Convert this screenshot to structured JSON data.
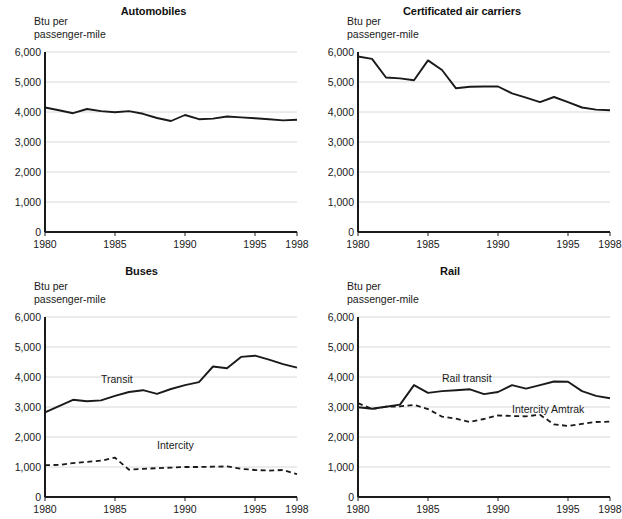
{
  "figure": {
    "axis_label": "Btu per\npassenger-mile",
    "x_ticks": [
      "1980",
      "1985",
      "1990",
      "1995",
      "1998"
    ],
    "x_tick_values": [
      1980,
      1985,
      1990,
      1995,
      1998
    ],
    "y_ticks": [
      "0",
      "1,000",
      "2,000",
      "3,000",
      "4,000",
      "5,000",
      "6,000"
    ],
    "y_tick_values": [
      0,
      1000,
      2000,
      3000,
      4000,
      5000,
      6000
    ],
    "line_color": "#1a1a1a",
    "grid_color": "#d8d8d8",
    "axis_color": "#1a1a1a"
  },
  "panels": [
    {
      "id": "automobiles",
      "title": "Automobiles"
    },
    {
      "id": "air-carriers",
      "title": "Certificated air carriers"
    },
    {
      "id": "buses",
      "title": "Buses"
    },
    {
      "id": "rail",
      "title": "Rail"
    }
  ],
  "chart_data": [
    {
      "type": "line",
      "title": "Automobiles",
      "xlabel": "",
      "ylabel": "Btu per passenger-mile",
      "xlim": [
        1980,
        1998
      ],
      "ylim": [
        0,
        6000
      ],
      "grid": true,
      "legend": "none",
      "x": [
        1980,
        1981,
        1982,
        1983,
        1984,
        1985,
        1986,
        1987,
        1988,
        1989,
        1990,
        1991,
        1992,
        1993,
        1994,
        1995,
        1996,
        1997,
        1998
      ],
      "series": [
        {
          "name": "Automobiles",
          "style": "solid",
          "values": [
            4150,
            4060,
            3960,
            4100,
            4030,
            3990,
            4030,
            3940,
            3800,
            3700,
            3900,
            3760,
            3780,
            3850,
            3820,
            3790,
            3760,
            3720,
            3740
          ]
        }
      ]
    },
    {
      "type": "line",
      "title": "Certificated air carriers",
      "xlabel": "",
      "ylabel": "Btu per passenger-mile",
      "xlim": [
        1980,
        1998
      ],
      "ylim": [
        0,
        6000
      ],
      "grid": true,
      "legend": "none",
      "x": [
        1980,
        1981,
        1982,
        1983,
        1984,
        1985,
        1986,
        1987,
        1988,
        1989,
        1990,
        1991,
        1992,
        1993,
        1994,
        1995,
        1996,
        1997,
        1998
      ],
      "series": [
        {
          "name": "Certificated air carriers",
          "style": "solid",
          "values": [
            5850,
            5770,
            5150,
            5120,
            5060,
            5720,
            5400,
            4790,
            4840,
            4850,
            4850,
            4620,
            4480,
            4330,
            4500,
            4330,
            4150,
            4080,
            4060
          ]
        }
      ]
    },
    {
      "type": "line",
      "title": "Buses",
      "xlabel": "",
      "ylabel": "Btu per passenger-mile",
      "xlim": [
        1980,
        1998
      ],
      "ylim": [
        0,
        6000
      ],
      "grid": true,
      "legend": "inline",
      "x": [
        1980,
        1981,
        1982,
        1983,
        1984,
        1985,
        1986,
        1987,
        1988,
        1989,
        1990,
        1991,
        1992,
        1993,
        1994,
        1995,
        1996,
        1997,
        1998
      ],
      "series": [
        {
          "name": "Transit",
          "style": "solid",
          "label_x": 1984,
          "label_y": 3900,
          "values": [
            2820,
            3030,
            3240,
            3190,
            3220,
            3370,
            3500,
            3560,
            3440,
            3600,
            3730,
            3830,
            4350,
            4290,
            4670,
            4710,
            4580,
            4430,
            4310
          ]
        },
        {
          "name": "Intercity",
          "style": "dashed",
          "label_x": 1988,
          "label_y": 1700,
          "values": [
            1060,
            1070,
            1130,
            1170,
            1210,
            1310,
            910,
            940,
            960,
            980,
            1000,
            1000,
            1010,
            1020,
            940,
            900,
            880,
            900,
            760
          ]
        }
      ]
    },
    {
      "type": "line",
      "title": "Rail",
      "xlabel": "",
      "ylabel": "Btu per passenger-mile",
      "xlim": [
        1980,
        1998
      ],
      "ylim": [
        0,
        6000
      ],
      "grid": true,
      "legend": "inline",
      "x": [
        1980,
        1981,
        1982,
        1983,
        1984,
        1985,
        1986,
        1987,
        1988,
        1989,
        1990,
        1991,
        1992,
        1993,
        1994,
        1995,
        1996,
        1997,
        1998
      ],
      "series": [
        {
          "name": "Rail transit",
          "style": "solid",
          "label_x": 1986,
          "label_y": 3920,
          "values": [
            2990,
            2940,
            3010,
            3080,
            3730,
            3470,
            3530,
            3560,
            3590,
            3430,
            3500,
            3730,
            3610,
            3730,
            3850,
            3840,
            3530,
            3370,
            3290
          ]
        },
        {
          "name": "Intercity Amtrak",
          "style": "dashed",
          "label_x": 1991,
          "label_y": 2900,
          "values": [
            3130,
            2930,
            3010,
            3020,
            3070,
            2930,
            2680,
            2610,
            2500,
            2600,
            2720,
            2700,
            2690,
            2740,
            2420,
            2370,
            2440,
            2500,
            2510
          ]
        }
      ]
    }
  ]
}
